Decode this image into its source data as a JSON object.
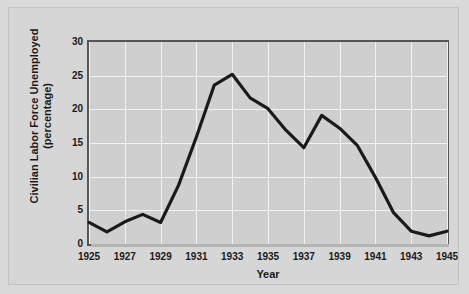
{
  "chart_data": {
    "type": "line",
    "title": "",
    "xlabel": "Year",
    "ylabel": "Civilian Labor Force Unemployed (percentage)",
    "ylabel_line1": "Civilian Labor Force Unemployed",
    "ylabel_line2": "(percentage)",
    "xlim": [
      1925,
      1945
    ],
    "ylim": [
      0,
      30
    ],
    "xticks": [
      1925,
      1927,
      1929,
      1931,
      1933,
      1935,
      1937,
      1939,
      1941,
      1943,
      1945
    ],
    "xtick_labels": [
      "1925",
      "1927",
      "1929",
      "1931",
      "1933",
      "1935",
      "1937",
      "1939",
      "1941",
      "1943",
      "1945"
    ],
    "yticks": [
      0,
      5,
      10,
      15,
      20,
      25,
      30
    ],
    "ytick_labels": [
      "0",
      "5",
      "10",
      "15",
      "20",
      "25",
      "30"
    ],
    "grid": true,
    "grid_color": "#f2f2f2",
    "legend": null,
    "line_color": "#1a1a1a",
    "plot_background": "#cfcfcf",
    "figure_background": "#d6d6d6",
    "x": [
      1925,
      1926,
      1927,
      1928,
      1929,
      1930,
      1931,
      1932,
      1933,
      1934,
      1935,
      1936,
      1937,
      1938,
      1939,
      1940,
      1941,
      1942,
      1943,
      1944,
      1945
    ],
    "values": [
      3.2,
      1.8,
      3.3,
      4.4,
      3.2,
      8.7,
      15.9,
      23.6,
      25.2,
      21.7,
      20.1,
      16.9,
      14.3,
      19.1,
      17.2,
      14.6,
      9.9,
      4.7,
      1.9,
      1.2,
      1.9
    ],
    "series": [
      {
        "name": "Civilian Labor Force Unemployed",
        "values": [
          3.2,
          1.8,
          3.3,
          4.4,
          3.2,
          8.7,
          15.9,
          23.6,
          25.2,
          21.7,
          20.1,
          16.9,
          14.3,
          19.1,
          17.2,
          14.6,
          9.9,
          4.7,
          1.9,
          1.2,
          1.9
        ]
      }
    ]
  }
}
